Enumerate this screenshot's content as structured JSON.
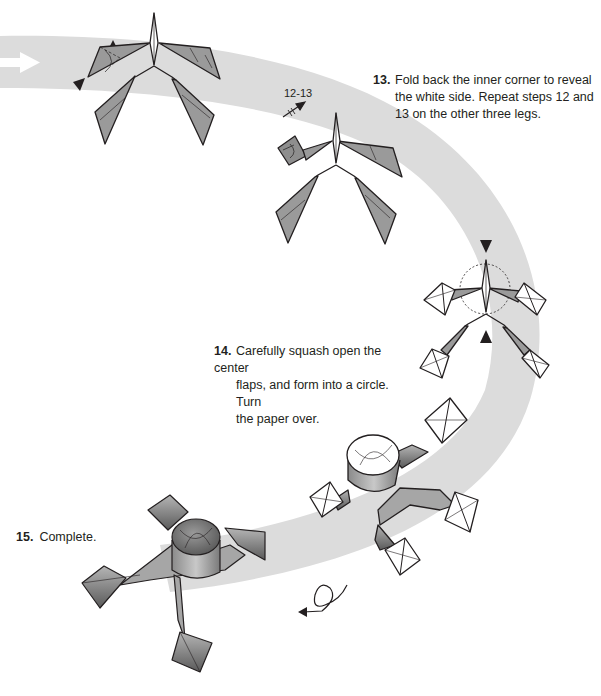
{
  "colors": {
    "band": "#dcdcdc",
    "paper_fill": "#9a9a9a",
    "paper_dark": "#6e6e6e",
    "outline": "#231f20",
    "white_side": "#ffffff",
    "background": "#ffffff"
  },
  "steps": [
    {
      "number": "13.",
      "lines": [
        "Fold back the inner corner to reveal",
        "the white side. Repeat steps 12 and",
        "13 on the other three legs."
      ]
    },
    {
      "number": "14.",
      "lines": [
        "Carefully squash open the center",
        "flaps, and form into a circle. Turn",
        "the paper over."
      ]
    },
    {
      "number": "15.",
      "lines": [
        "Complete."
      ]
    }
  ],
  "annotations": {
    "repeat_label": "12-13"
  },
  "icons": {
    "flow_arrow": "white-right-arrow-icon",
    "fold_arrow_step12": "black-triangle-arrow-icon",
    "repeat_arrow": "repeat-arrow-icon",
    "squash_arrows": "black-triangle-arrows-icon",
    "squash_circle": "dotted-circle-icon",
    "turn_over": "turn-over-loop-arrow-icon"
  },
  "figures": [
    {
      "id": "step12-model",
      "description": "gray four-legged base with inner corner fold marked"
    },
    {
      "id": "step13-model",
      "description": "model with one corner folded back"
    },
    {
      "id": "step14-model",
      "description": "all four leg tips white squares, center flaps marked"
    },
    {
      "id": "step14-result",
      "description": "center formed into a circle, white-tipped legs"
    },
    {
      "id": "step15-model",
      "description": "completed model, gray side up"
    }
  ]
}
